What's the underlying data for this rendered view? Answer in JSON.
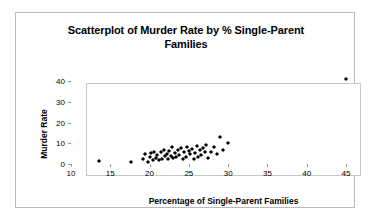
{
  "chart_data": {
    "type": "scatter",
    "title": "Scatterplot of Murder Rate by % Single-Parent Families",
    "title_line1": "Scatterplot of Murder Rate by % Single-Parent",
    "title_line2": "Families",
    "xlabel": "Percentage of Single-Parent Families",
    "ylabel": "Murder Rate",
    "xlim": [
      10,
      45
    ],
    "ylim": [
      0,
      45
    ],
    "xticks": [
      10,
      15,
      20,
      25,
      30,
      35,
      40,
      45
    ],
    "yticks": [
      0,
      10,
      20,
      30,
      40
    ],
    "xtick_labels": [
      "10",
      "15",
      "20",
      "25",
      "30",
      "35",
      "40",
      "45"
    ],
    "ytick_labels": [
      "0",
      "10",
      "20",
      "30",
      "40"
    ],
    "grid": false,
    "legend": false,
    "marker": "diamond",
    "marker_color": "#000000",
    "points": [
      [
        13.5,
        1.6
      ],
      [
        17.6,
        1.0
      ],
      [
        19.2,
        2.3
      ],
      [
        19.4,
        4.6
      ],
      [
        19.8,
        1.2
      ],
      [
        20.0,
        3.4
      ],
      [
        20.2,
        5.2
      ],
      [
        20.4,
        2.0
      ],
      [
        20.6,
        6.0
      ],
      [
        20.8,
        3.0
      ],
      [
        21.0,
        4.2
      ],
      [
        21.2,
        1.8
      ],
      [
        21.4,
        5.6
      ],
      [
        21.6,
        2.6
      ],
      [
        21.8,
        7.0
      ],
      [
        22.0,
        3.8
      ],
      [
        22.2,
        5.0
      ],
      [
        22.4,
        2.2
      ],
      [
        22.5,
        6.4
      ],
      [
        22.7,
        4.0
      ],
      [
        22.9,
        8.0
      ],
      [
        23.0,
        2.8
      ],
      [
        23.2,
        5.4
      ],
      [
        23.4,
        3.2
      ],
      [
        23.6,
        6.8
      ],
      [
        23.8,
        4.4
      ],
      [
        24.0,
        7.6
      ],
      [
        24.2,
        2.4
      ],
      [
        24.4,
        5.8
      ],
      [
        24.6,
        3.6
      ],
      [
        24.8,
        8.4
      ],
      [
        25.0,
        6.2
      ],
      [
        25.2,
        4.8
      ],
      [
        25.4,
        7.2
      ],
      [
        25.6,
        2.6
      ],
      [
        25.8,
        5.2
      ],
      [
        26.0,
        8.8
      ],
      [
        26.2,
        3.4
      ],
      [
        26.4,
        6.6
      ],
      [
        26.6,
        4.4
      ],
      [
        26.8,
        7.8
      ],
      [
        27.0,
        5.6
      ],
      [
        27.2,
        9.0
      ],
      [
        27.4,
        3.0
      ],
      [
        27.8,
        6.0
      ],
      [
        28.2,
        8.2
      ],
      [
        28.6,
        4.6
      ],
      [
        29.0,
        13.0
      ],
      [
        29.4,
        7.0
      ],
      [
        30.0,
        10.0
      ],
      [
        45.0,
        41.0
      ]
    ]
  }
}
